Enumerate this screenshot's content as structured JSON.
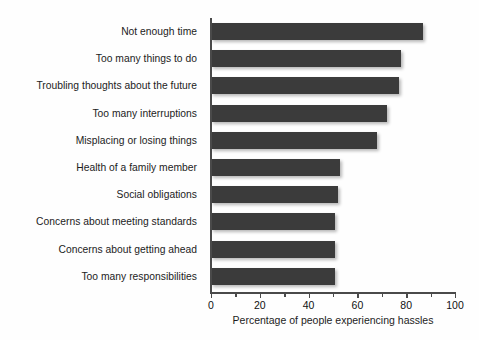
{
  "chart_data": {
    "type": "bar",
    "orientation": "horizontal",
    "title": "",
    "xlabel": "Percentage of people experiencing hassles",
    "ylabel": "",
    "xlim": [
      0,
      100
    ],
    "grid": false,
    "legend": null,
    "major_ticks": [
      0,
      20,
      40,
      60,
      80,
      100
    ],
    "minor_ticks": [
      10,
      30,
      50,
      70,
      90
    ],
    "tick_labels": [
      "0",
      "20",
      "40",
      "60",
      "80",
      "100"
    ],
    "bar_color": "#3b3b3b",
    "categories": [
      "Not enough time",
      "Too many things to do",
      "Troubling thoughts about the future",
      "Too many interruptions",
      "Misplacing or losing things",
      "Health of a family member",
      "Social obligations",
      "Concerns about meeting standards",
      "Concerns about getting ahead",
      "Too many responsibilities"
    ],
    "values": [
      87,
      78,
      77,
      72,
      68,
      53,
      52,
      51,
      51,
      51
    ]
  }
}
